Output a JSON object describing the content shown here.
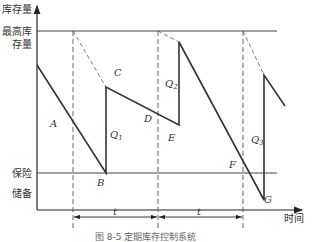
{
  "diagram": {
    "type": "inventory-level-vs-time",
    "axes": {
      "y_label": "库存量",
      "x_label": "时间"
    },
    "reference_lines": {
      "max_inventory_label_line1": "最高库",
      "max_inventory_label_line2": "存量",
      "safety_stock_label_line1": "保险",
      "safety_stock_label_line2": "储备"
    },
    "points": {
      "A": "A",
      "B": "B",
      "C": "C",
      "D": "D",
      "E": "E",
      "F": "F",
      "G": "G"
    },
    "order_quantities": {
      "q1": "Q",
      "q1_sub": "1",
      "q2": "Q",
      "q2_sub": "2",
      "q3": "Q",
      "q3_sub": "3"
    },
    "intervals": {
      "t1": "t",
      "t2": "t"
    },
    "caption": "图 8-5  定期库存控制系统"
  },
  "colors": {
    "line": "#333333",
    "dashed": "#555555",
    "guide": "#444444"
  }
}
